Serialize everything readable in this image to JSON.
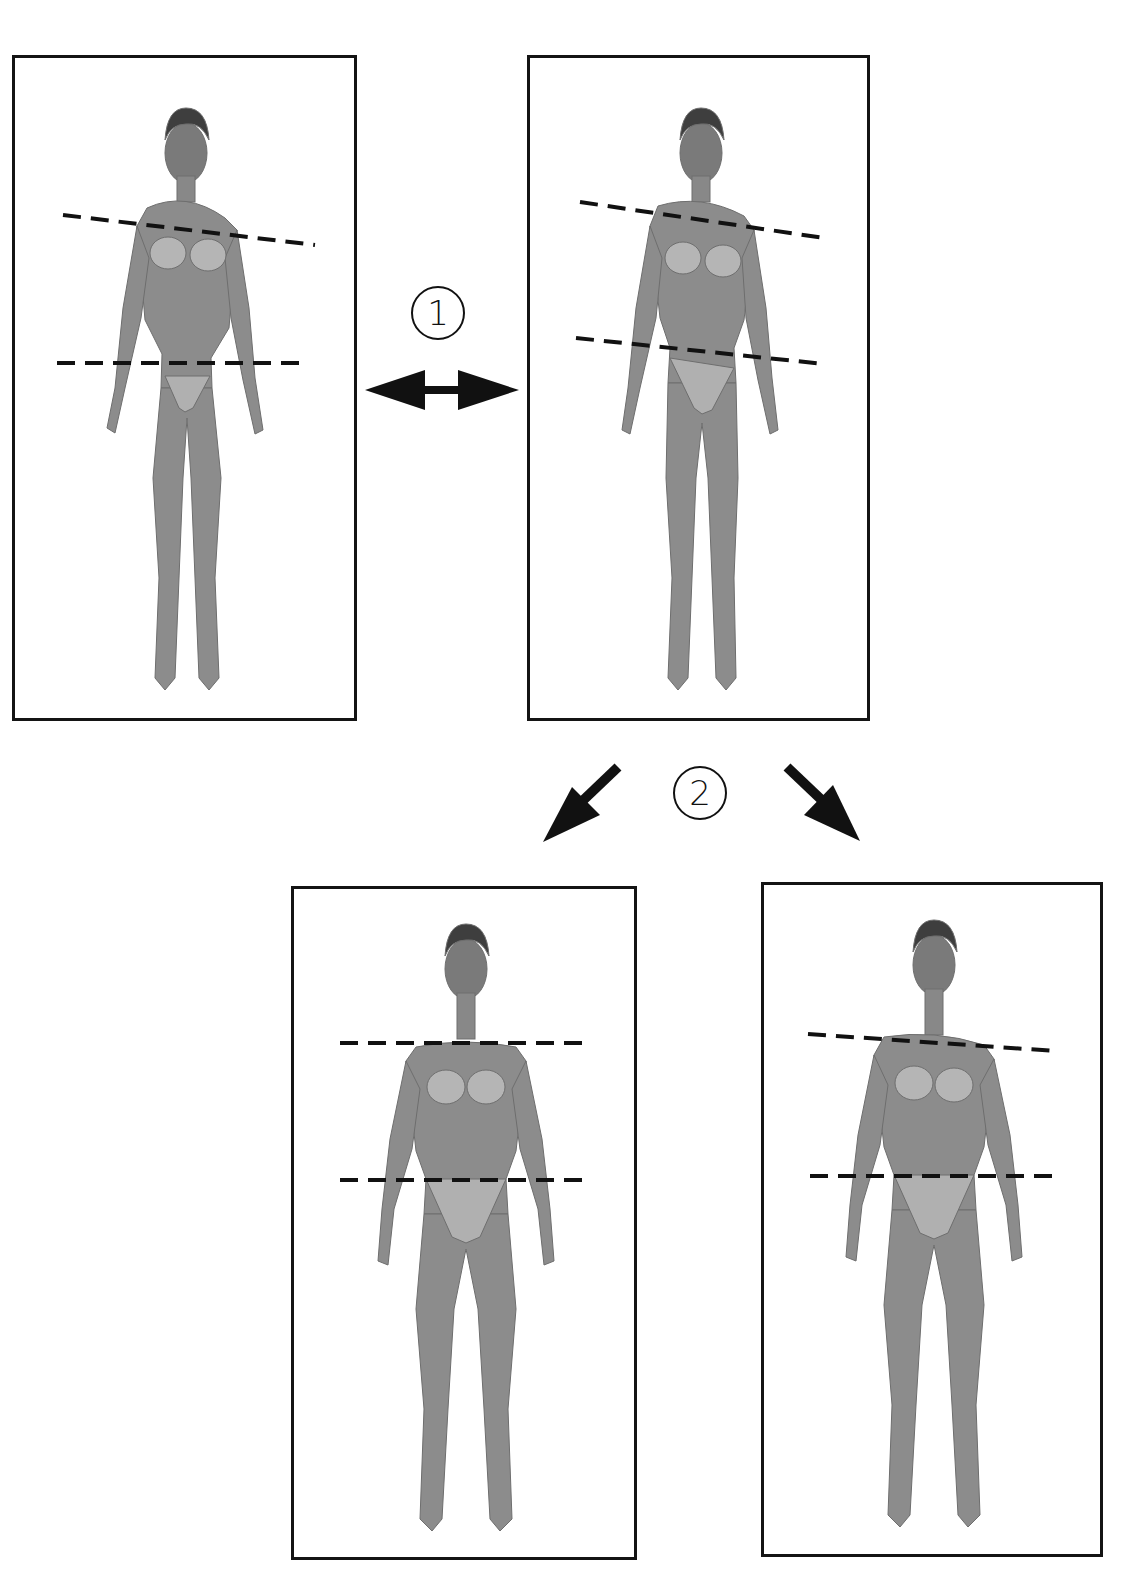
{
  "diagram": {
    "type": "posture-comparison",
    "panels": [
      {
        "id": "panel-1",
        "position": "top-left",
        "box": [
          12,
          55,
          345,
          666
        ],
        "lines": [
          {
            "name": "shoulder-line",
            "x1": 63,
            "y1": 215,
            "x2": 315,
            "y2": 245
          },
          {
            "name": "hip-line",
            "x1": 57,
            "y1": 363,
            "x2": 308,
            "y2": 363
          }
        ]
      },
      {
        "id": "panel-2",
        "position": "top-right",
        "box": [
          527,
          55,
          343,
          666
        ],
        "lines": [
          {
            "name": "shoulder-line",
            "x1": 580,
            "y1": 202,
            "x2": 824,
            "y2": 238
          },
          {
            "name": "hip-line",
            "x1": 576,
            "y1": 338,
            "x2": 824,
            "y2": 364
          }
        ]
      },
      {
        "id": "panel-3",
        "position": "bottom-middle",
        "box": [
          291,
          886,
          346,
          674
        ],
        "lines": [
          {
            "name": "shoulder-line",
            "x1": 340,
            "y1": 1043,
            "x2": 592,
            "y2": 1043
          },
          {
            "name": "hip-line",
            "x1": 340,
            "y1": 1180,
            "x2": 592,
            "y2": 1180
          }
        ]
      },
      {
        "id": "panel-4",
        "position": "bottom-right",
        "box": [
          761,
          882,
          342,
          675
        ],
        "lines": [
          {
            "name": "shoulder-line",
            "x1": 808,
            "y1": 1034,
            "x2": 1056,
            "y2": 1051
          },
          {
            "name": "hip-line",
            "x1": 810,
            "y1": 1176,
            "x2": 1056,
            "y2": 1176
          }
        ]
      }
    ],
    "markers": [
      {
        "id": "step-1",
        "label": "1",
        "glyph": "①",
        "cx": 437,
        "cy": 313
      },
      {
        "id": "step-2",
        "label": "2",
        "glyph": "②",
        "cx": 700,
        "cy": 792
      }
    ],
    "arrows": [
      {
        "name": "double-arrow-horizontal",
        "between": [
          "panel-1",
          "panel-2"
        ]
      },
      {
        "name": "arrow-down-left",
        "to": "panel-3"
      },
      {
        "name": "arrow-down-right",
        "to": "panel-4"
      }
    ],
    "colors": {
      "frame": "#141414",
      "figure": "#8a8a8a",
      "line": "#111111",
      "background": "#ffffff"
    }
  }
}
